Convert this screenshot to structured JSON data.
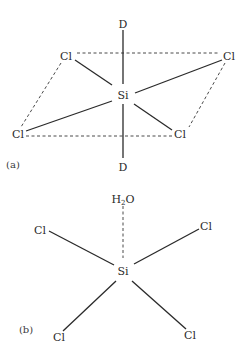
{
  "figure": {
    "panel_a": {
      "label": "(a)",
      "center": "Si",
      "axial_top": "D",
      "axial_bottom": "D",
      "equatorial": [
        "Cl",
        "Cl",
        "Cl",
        "Cl"
      ],
      "caption_note": "Octahedral SiCl4 with two axial D ligands; Cl atoms form a dashed square plane"
    },
    "panel_b": {
      "label": "(b)",
      "center": "Si",
      "axial_top_prefix": "H",
      "axial_top_sub": "2",
      "axial_top_suffix": "O",
      "ligands": [
        "Cl",
        "Cl",
        "Cl",
        "Cl"
      ],
      "caption_note": "SiCl4 with H2O approaching via a dashed (weak) interaction"
    }
  }
}
